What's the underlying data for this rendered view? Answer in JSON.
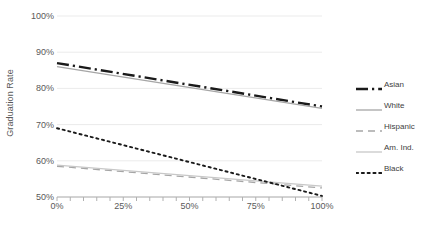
{
  "chart_data": {
    "type": "line",
    "title": "",
    "xlabel": "",
    "ylabel": "Graduation Rate",
    "xlim": [
      0,
      100
    ],
    "ylim": [
      50,
      100
    ],
    "grid": true,
    "legend_position": "right",
    "x_tick_labels": [
      "0%",
      "25%",
      "50%",
      "75%",
      "100%"
    ],
    "x_ticks": [
      0,
      25,
      50,
      75,
      100
    ],
    "y_tick_labels": [
      "50%",
      "60%",
      "70%",
      "80%",
      "90%",
      "100%"
    ],
    "y_ticks": [
      50,
      60,
      70,
      80,
      90,
      100
    ],
    "x": [
      0,
      100
    ],
    "series": [
      {
        "name": "Asian",
        "values": [
          87,
          75
        ],
        "color": "#1a1a1a",
        "style": "dash-dot",
        "width": 2.4
      },
      {
        "name": "White",
        "values": [
          86,
          74.5
        ],
        "color": "#a6a6a6",
        "style": "solid",
        "width": 1.3
      },
      {
        "name": "Hispanic",
        "values": [
          58.5,
          52.5
        ],
        "color": "#a6a6a6",
        "style": "dashed",
        "width": 1.3
      },
      {
        "name": "Am. Ind.",
        "values": [
          58.8,
          53
        ],
        "color": "#c8c8c8",
        "style": "solid",
        "width": 1.3
      },
      {
        "name": "Black",
        "values": [
          69,
          50.3
        ],
        "color": "#1a1a1a",
        "style": "dotted",
        "width": 1.9
      }
    ]
  },
  "legend": {
    "items": [
      {
        "label": "Asian"
      },
      {
        "label": "White"
      },
      {
        "label": "Hispanic"
      },
      {
        "label": "Am. Ind."
      },
      {
        "label": "Black"
      }
    ]
  }
}
